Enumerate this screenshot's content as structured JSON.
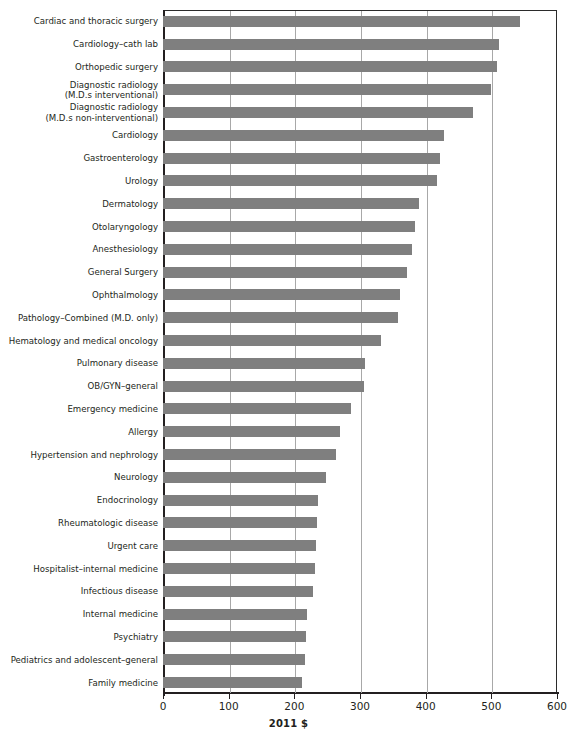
{
  "chart_data": {
    "type": "bar",
    "orientation": "horizontal",
    "title": "",
    "subtitle": "",
    "xlabel": "2011 $",
    "ylabel": "",
    "xlim": [
      0,
      600
    ],
    "ylim": null,
    "grid": "vertical",
    "legend": "none",
    "xticks": [
      0,
      100,
      200,
      300,
      400,
      500,
      600
    ],
    "xticklabels": [
      "0",
      "100",
      "200",
      "300",
      "400",
      "500",
      "600"
    ],
    "bar_color": "#7f7f7f",
    "axis_color": "#231f20",
    "gridline_color": "#a8a8a8",
    "categories": [
      "Cardiac and thoracic surgery",
      "Cardiology–cath lab",
      "Orthopedic surgery",
      "Diagnostic radiology\n(M.D.s interventional)",
      "Diagnostic radiology\n(M.D.s non-interventional)",
      "Cardiology",
      "Gastroenterology",
      "Urology",
      "Dermatology",
      "Otolaryngology",
      "Anesthesiology",
      "General Surgery",
      "Ophthalmology",
      "Pathology–Combined (M.D. only)",
      "Hematology and medical oncology",
      "Pulmonary disease",
      "OB/GYN–general",
      "Emergency medicine",
      "Allergy",
      "Hypertension and nephrology",
      "Neurology",
      "Endocrinology",
      "Rheumatologic disease",
      "Urgent care",
      "Hospitalist–internal medicine",
      "Infectious disease",
      "Internal medicine",
      "Psychiatry",
      "Pediatrics and adolescent–general",
      "Family medicine"
    ],
    "values": [
      544,
      512,
      509,
      500,
      472,
      428,
      422,
      417,
      390,
      384,
      379,
      372,
      361,
      358,
      332,
      308,
      306,
      286,
      270,
      263,
      248,
      236,
      235,
      233,
      232,
      228,
      219,
      218,
      216,
      211
    ]
  }
}
